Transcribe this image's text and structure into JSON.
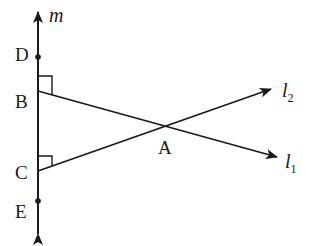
{
  "diagram": {
    "type": "geometry",
    "stroke_color": "#1a1a1a",
    "background": "#ffffff",
    "lines": {
      "m": {
        "label": "m",
        "from": [
          38,
          236
        ],
        "to": [
          38,
          10
        ],
        "arrows": "both"
      },
      "l1": {
        "label": "l",
        "subscript": "1",
        "from": [
          38,
          91
        ],
        "to": [
          278,
          157
        ],
        "arrow": "end"
      },
      "l2": {
        "label": "l",
        "subscript": "2",
        "from": [
          38,
          171
        ],
        "to": [
          272,
          89
        ],
        "arrow": "end"
      }
    },
    "points": [
      {
        "name": "D",
        "x": 38,
        "y": 57,
        "dot": true
      },
      {
        "name": "B",
        "x": 38,
        "y": 91,
        "dot": false
      },
      {
        "name": "A",
        "x": 165,
        "y": 126,
        "dot": false
      },
      {
        "name": "C",
        "x": 38,
        "y": 171,
        "dot": false
      },
      {
        "name": "E",
        "x": 38,
        "y": 201,
        "dot": true
      }
    ],
    "labels": {
      "m": "m",
      "D": "D",
      "B": "B",
      "A": "A",
      "C": "C",
      "E": "E",
      "l1_main": "l",
      "l1_sub": "1",
      "l2_main": "l",
      "l2_sub": "2"
    },
    "right_angles": [
      "B",
      "C"
    ]
  }
}
